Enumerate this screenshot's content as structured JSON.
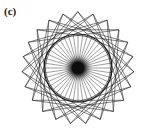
{
  "figure": {
    "panel_label": "(c)",
    "background_color": "#ffffff",
    "stroke_color": "#1a1a1a",
    "center_blob_color": "#0d0d0d"
  },
  "chart_data": {
    "type": "scatter",
    "title": "(c)",
    "subtitle": "",
    "xlabel": "",
    "ylabel": "",
    "grid": false,
    "legend_position": "none",
    "axes_visible": false,
    "center": {
      "x": 78,
      "y": 68
    },
    "circle": {
      "radius": 34,
      "stroke_width": 1.15,
      "color": "#1a1a1a",
      "left_edge_x": 44,
      "right_edge_x": 112,
      "top_edge_y": 34,
      "bottom_edge_y": 102
    },
    "spokes": {
      "count": 44,
      "inner_radius": 0,
      "outer_radius": 34,
      "stroke_width": 0.45,
      "color": "#2b2b2b",
      "start_angle_deg": 0
    },
    "star_polygon": {
      "vertex_count": 23,
      "step": 6,
      "circumradius": 56,
      "stroke_width": 0.55,
      "color": "#1a1a1a",
      "top_extent_y": 13,
      "bottom_extent_y": 124,
      "left_extent_x": 32,
      "right_extent_x": 124
    },
    "center_hub": {
      "radius": 6,
      "halo_radius": 16,
      "color": "#0d0d0d"
    }
  }
}
